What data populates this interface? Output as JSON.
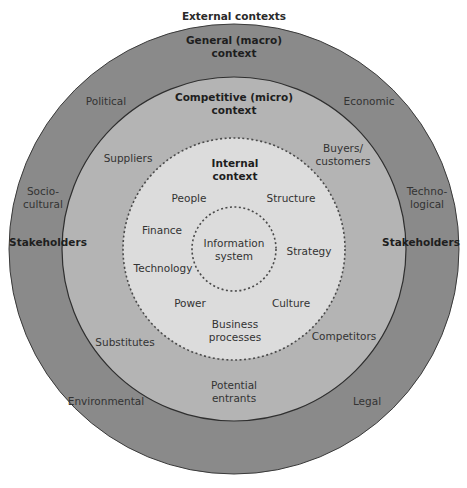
{
  "diagram": {
    "title": "External contexts",
    "colors": {
      "background": "#ffffff",
      "outer_ring": "#8a8a8a",
      "middle_ring": "#b4b4b4",
      "internal_circle": "#dcdcdc",
      "info_system_circle": "#dcdcdc",
      "ring_stroke": "#3a3a3a",
      "dashed_stroke": "#4a4a4a",
      "text": "#333333"
    },
    "geometry": {
      "center": [
        234,
        249
      ],
      "outer_radius": 225,
      "middle_radius": 172,
      "internal_radius": 111,
      "info_system_radius": 42
    },
    "rings": {
      "general": {
        "heading": [
          "General (macro)",
          "context"
        ],
        "factors": {
          "political": "Political",
          "economic": "Economic",
          "sociocultural": [
            "Socio-",
            "cultural"
          ],
          "technological": [
            "Techno-",
            "logical"
          ],
          "environmental": "Environmental",
          "legal": "Legal"
        },
        "stakeholders_left": "Stakeholders",
        "stakeholders_right": "Stakeholders"
      },
      "competitive": {
        "heading": [
          "Competitive (micro)",
          "context"
        ],
        "factors": {
          "suppliers": "Suppliers",
          "buyers": [
            "Buyers/",
            "customers"
          ],
          "substitutes": "Substitutes",
          "competitors": "Competitors",
          "entrants": [
            "Potential",
            "entrants"
          ]
        }
      },
      "internal": {
        "heading": [
          "Internal",
          "context"
        ],
        "factors": {
          "people": "People",
          "structure": "Structure",
          "finance": "Finance",
          "strategy": "Strategy",
          "technology": "Technology",
          "power": "Power",
          "culture": "Culture",
          "business_processes": [
            "Business",
            "processes"
          ]
        }
      },
      "core": {
        "label": [
          "Information",
          "system"
        ]
      }
    }
  }
}
